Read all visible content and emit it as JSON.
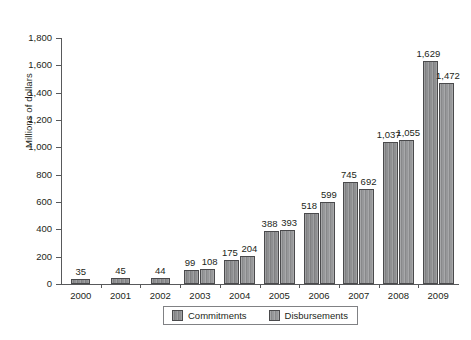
{
  "chart_data": {
    "type": "bar",
    "title": "",
    "subtitle": "",
    "xlabel": "",
    "ylabel": "Millions of dollars",
    "ylim": [
      0,
      1800
    ],
    "yticks": [
      "0",
      "200",
      "400",
      "600",
      "800",
      "1,000",
      "1,200",
      "1,400",
      "1,600",
      "1,800"
    ],
    "ytick_values": [
      0,
      200,
      400,
      600,
      800,
      1000,
      1200,
      1400,
      1600,
      1800
    ],
    "grid": false,
    "legend_position": "bottom",
    "categories": [
      "2000",
      "2001",
      "2002",
      "2003",
      "2004",
      "2005",
      "2006",
      "2007",
      "2008",
      "2009"
    ],
    "series": [
      {
        "name": "Commitments",
        "values": [
          35,
          45,
          44,
          99,
          175,
          388,
          518,
          745,
          1037,
          1629
        ],
        "labels": [
          "35",
          "45",
          "44",
          "99",
          "175",
          "388",
          "518",
          "745",
          "1,037",
          "1,629"
        ],
        "color": "#8e8f91"
      },
      {
        "name": "Disbursements",
        "values": [
          null,
          null,
          null,
          108,
          204,
          393,
          599,
          692,
          1055,
          1472
        ],
        "labels": [
          "",
          "",
          "",
          "108",
          "204",
          "393",
          "599",
          "692",
          "1,055",
          "1,472"
        ],
        "color": "#97989a"
      }
    ]
  },
  "legend": {
    "items": [
      {
        "label": "Commitments"
      },
      {
        "label": "Disbursements"
      }
    ]
  }
}
